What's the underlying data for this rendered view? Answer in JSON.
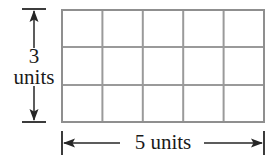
{
  "figure": {
    "type": "rectangle-grid-area-diagram",
    "background_color": "#ffffff",
    "grid": {
      "columns": 5,
      "rows": 3,
      "total_cells": 15,
      "line_color": "#9a9a9a",
      "outer_line_color": "#8f8f8f",
      "cell_fill": "#ffffff"
    },
    "height_dimension": {
      "value": "3",
      "unit": "units",
      "orientation": "vertical",
      "arrow_style": "double-headed-with-end-caps",
      "color": "#262626"
    },
    "width_dimension": {
      "value": "5",
      "unit": "units",
      "orientation": "horizontal",
      "arrow_style": "double-headed-with-end-caps",
      "color": "#262626"
    }
  }
}
